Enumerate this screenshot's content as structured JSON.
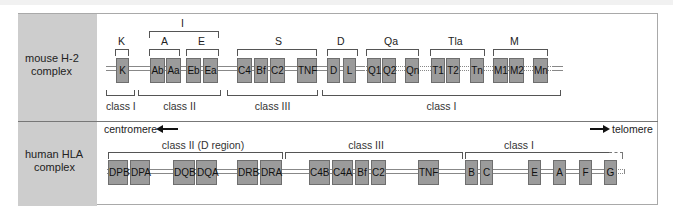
{
  "mouse": {
    "species_label": "mouse H-2 complex",
    "species_lines": [
      "mouse H-2",
      "complex"
    ],
    "region_I_label": "I",
    "subregions": [
      {
        "label": "K"
      },
      {
        "label": "A"
      },
      {
        "label": "E"
      },
      {
        "label": "S"
      },
      {
        "label": "D"
      },
      {
        "label": "Qa"
      },
      {
        "label": "Tla"
      },
      {
        "label": "M"
      }
    ],
    "genes": [
      {
        "label": "K"
      },
      {
        "label": "Ab"
      },
      {
        "label": "Aa"
      },
      {
        "label": "Eb"
      },
      {
        "label": "Ea"
      },
      {
        "label": "C4"
      },
      {
        "label": "Bf"
      },
      {
        "label": "C2"
      },
      {
        "label": "TNF"
      },
      {
        "label": "D"
      },
      {
        "label": "L"
      },
      {
        "label": "Q1"
      },
      {
        "label": "Q2"
      },
      {
        "label": "Qn"
      },
      {
        "label": "T1"
      },
      {
        "label": "T2"
      },
      {
        "label": "Tn"
      },
      {
        "label": "M1"
      },
      {
        "label": "M2"
      },
      {
        "label": "Mn"
      }
    ],
    "classes": [
      {
        "label": "class I"
      },
      {
        "label": "class II"
      },
      {
        "label": "class III"
      },
      {
        "label": "class I"
      }
    ]
  },
  "human": {
    "species_label": "human HLA complex",
    "species_lines": [
      "human HLA",
      "complex"
    ],
    "centromere_label": "centromere",
    "telomere_label": "telomere",
    "classes": [
      {
        "label": "class II (D region)"
      },
      {
        "label": "class III"
      },
      {
        "label": "class I"
      }
    ],
    "genes": [
      {
        "label": "DPB"
      },
      {
        "label": "DPA"
      },
      {
        "label": "DQB"
      },
      {
        "label": "DQA"
      },
      {
        "label": "DRB"
      },
      {
        "label": "DRA"
      },
      {
        "label": "C4B"
      },
      {
        "label": "C4A"
      },
      {
        "label": "Bf"
      },
      {
        "label": "C2"
      },
      {
        "label": "TNF"
      },
      {
        "label": "B"
      },
      {
        "label": "C"
      },
      {
        "label": "E"
      },
      {
        "label": "A"
      },
      {
        "label": "F"
      },
      {
        "label": "G"
      }
    ]
  },
  "colors": {
    "gene_box": "#9b9b9b",
    "label_column": "#cdcdcd",
    "border": "#a9a9a9"
  }
}
